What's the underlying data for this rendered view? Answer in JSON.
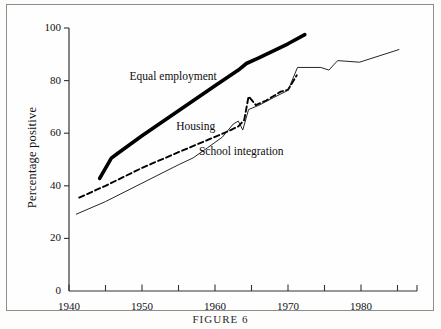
{
  "figure": {
    "caption": "FIGURE 6"
  },
  "chart_data": {
    "type": "line",
    "title": "",
    "xlabel": "",
    "ylabel": "Percentage positive",
    "xlim": [
      1940,
      1986.5
    ],
    "ylim": [
      0,
      100
    ],
    "grid": false,
    "legend": "inline-labels",
    "x_ticks_major": [
      "1940",
      "1950",
      "1960",
      "1970",
      "1980"
    ],
    "x_ticks_major_values": [
      1940,
      1950,
      1960,
      1970,
      1980
    ],
    "x_ticks_minor_values": [
      1945,
      1955,
      1965,
      1975,
      1985
    ],
    "y_ticks": [
      "0",
      "20",
      "40",
      "60",
      "80",
      "100"
    ],
    "y_tick_values": [
      0,
      20,
      40,
      60,
      80,
      100
    ],
    "series": [
      {
        "name": "Equal employment",
        "style": "thick-solid",
        "color": "#000000",
        "label_x": 1948.3,
        "label_y": 81.5,
        "points": [
          [
            1944.2,
            42.8
          ],
          [
            1945.8,
            50.5
          ],
          [
            1946.6,
            52.2
          ],
          [
            1950.0,
            59.0
          ],
          [
            1955.0,
            68.5
          ],
          [
            1960.0,
            78.0
          ],
          [
            1963.2,
            84.0
          ],
          [
            1964.3,
            86.5
          ],
          [
            1966.0,
            88.6
          ],
          [
            1970.0,
            94.0
          ],
          [
            1972.3,
            97.5
          ]
        ]
      },
      {
        "name": "Housing",
        "style": "dashed",
        "color": "#000000",
        "label_x": 1954.7,
        "label_y": 62.2,
        "points": [
          [
            1941.4,
            35.5
          ],
          [
            1945.0,
            40.0
          ],
          [
            1950.0,
            46.8
          ],
          [
            1955.0,
            52.8
          ],
          [
            1960.0,
            58.6
          ],
          [
            1962.0,
            61.0
          ],
          [
            1963.2,
            62.6
          ],
          [
            1964.0,
            65.0
          ],
          [
            1964.6,
            74.0
          ],
          [
            1965.6,
            70.7
          ],
          [
            1967.0,
            72.4
          ],
          [
            1969.0,
            75.8
          ],
          [
            1970.0,
            76.5
          ],
          [
            1971.2,
            82.0
          ]
        ]
      },
      {
        "name": "School integration",
        "style": "thin-solid",
        "color": "#1a1a1a",
        "label_x": 1957.8,
        "label_y": 52.8,
        "points": [
          [
            1941.0,
            29.2
          ],
          [
            1945.0,
            34.0
          ],
          [
            1950.0,
            41.0
          ],
          [
            1955.0,
            48.0
          ],
          [
            1957.0,
            50.6
          ],
          [
            1959.0,
            54.5
          ],
          [
            1961.0,
            58.5
          ],
          [
            1962.5,
            63.5
          ],
          [
            1963.2,
            64.6
          ],
          [
            1963.8,
            61.2
          ],
          [
            1964.6,
            69.0
          ],
          [
            1966.0,
            70.6
          ],
          [
            1968.0,
            73.5
          ],
          [
            1970.0,
            76.3
          ],
          [
            1971.3,
            85.0
          ],
          [
            1974.5,
            85.0
          ],
          [
            1975.6,
            84.0
          ],
          [
            1976.8,
            87.6
          ],
          [
            1979.8,
            87.0
          ],
          [
            1985.2,
            91.8
          ]
        ]
      }
    ]
  },
  "axes": {
    "y_axis_title": "Percentage positive"
  }
}
